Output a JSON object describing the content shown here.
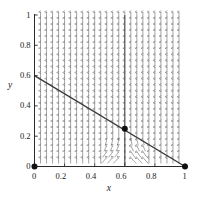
{
  "chart_data": {
    "type": "scatter",
    "title": "",
    "xlabel": "x",
    "ylabel": "y",
    "xlim": [
      0,
      1
    ],
    "ylim": [
      0,
      1
    ],
    "grid": false,
    "xticks": [
      0,
      0.2,
      0.4,
      0.6,
      0.8,
      1
    ],
    "xticklabels": [
      "0",
      "0.2",
      "0.4",
      "0.6",
      "0.8",
      "1"
    ],
    "yticks": [
      0,
      0.2,
      0.4,
      0.6,
      0.8,
      1
    ],
    "yticklabels": [
      "0",
      "0.2",
      "0.4",
      "0.6",
      "0.8",
      "1"
    ],
    "legend": null,
    "annotations": [],
    "series": [
      {
        "name": "diagonal-nullcline",
        "type": "line",
        "x": [
          0,
          1
        ],
        "y": [
          0.6,
          0
        ]
      },
      {
        "name": "vertical-nullcline",
        "type": "line",
        "x": [
          0.6,
          0.6
        ],
        "y": [
          0,
          1
        ]
      }
    ],
    "equilibria": [
      {
        "name": "origin-equilibrium",
        "x": 0,
        "y": 0,
        "marker": "filled-circle"
      },
      {
        "name": "interior-equilibrium",
        "x": 0.6,
        "y": 0.25,
        "marker": "filled-circle"
      },
      {
        "name": "boundary-equilibrium",
        "x": 1,
        "y": 0,
        "marker": "filled-circle"
      }
    ],
    "vector_field": {
      "style": "vertical-arrows",
      "x_samples": [
        0.04,
        0.08,
        0.12,
        0.16,
        0.2,
        0.24,
        0.28,
        0.32,
        0.36,
        0.4,
        0.44,
        0.48,
        0.52,
        0.56,
        0.6,
        0.64,
        0.68,
        0.72,
        0.76,
        0.8,
        0.84,
        0.88,
        0.92,
        0.96
      ],
      "y_samples": [
        0.04,
        0.08,
        0.12,
        0.16,
        0.2,
        0.24,
        0.28,
        0.32,
        0.36,
        0.4,
        0.44,
        0.48,
        0.52,
        0.56,
        0.6,
        0.64,
        0.68,
        0.72,
        0.76,
        0.8,
        0.84,
        0.88,
        0.92,
        0.96,
        1.0
      ],
      "direction_rule": "up-if-x-less-than-0.6-else-up; curved-inflow-near-x=0.6-low-y"
    }
  },
  "colors": {
    "line": "#3a3a3a",
    "axis": "#2a2a2a",
    "marker": "#111111",
    "field": "#555555",
    "background": "#ffffff"
  }
}
